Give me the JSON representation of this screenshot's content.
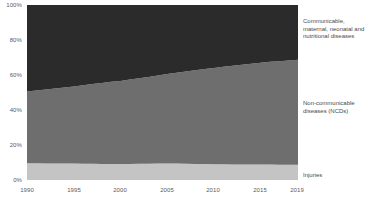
{
  "chart_data": {
    "type": "area",
    "stacked": true,
    "normalized": true,
    "title": "",
    "subtitle": "",
    "xlabel": "",
    "ylabel": "",
    "xlim": [
      1990,
      2019
    ],
    "ylim": [
      0,
      100
    ],
    "grid": false,
    "legend_position": "right",
    "x": [
      1990,
      1991,
      1992,
      1993,
      1994,
      1995,
      1996,
      1997,
      1998,
      1999,
      2000,
      2001,
      2002,
      2003,
      2004,
      2005,
      2006,
      2007,
      2008,
      2009,
      2010,
      2011,
      2012,
      2013,
      2014,
      2015,
      2016,
      2017,
      2018,
      2019
    ],
    "x_tick_labels": [
      "1990",
      "1995",
      "2000",
      "2005",
      "2010",
      "2015",
      "2019"
    ],
    "x_ticks": [
      1990,
      1995,
      2000,
      2005,
      2010,
      2015,
      2019
    ],
    "y_tick_labels": [
      "0%",
      "20%",
      "40%",
      "60%",
      "80%",
      "100%"
    ],
    "y_ticks": [
      0,
      20,
      40,
      60,
      80,
      100
    ],
    "series": [
      {
        "name": "Injuries",
        "color": "#c4c4c4",
        "legend_label": "Injuries",
        "values": [
          9.6,
          9.6,
          9.5,
          9.5,
          9.4,
          9.4,
          9.3,
          9.3,
          9.2,
          9.2,
          9.1,
          9.2,
          9.3,
          9.3,
          9.4,
          9.5,
          9.4,
          9.3,
          9.2,
          9.1,
          9.0,
          9.0,
          8.9,
          8.9,
          8.8,
          8.8,
          8.8,
          8.7,
          8.7,
          8.7
        ]
      },
      {
        "name": "Non-communicable diseases (NCDs)",
        "color": "#6e6e6e",
        "legend_label": "Non-communicable diseases (NCDs)",
        "values": [
          41.0,
          41.6,
          42.2,
          42.8,
          43.4,
          44.1,
          44.8,
          45.5,
          46.2,
          46.9,
          47.5,
          48.2,
          48.9,
          49.6,
          50.3,
          51.1,
          51.9,
          52.7,
          53.5,
          54.3,
          55.0,
          55.7,
          56.4,
          57.0,
          57.6,
          58.2,
          58.7,
          59.2,
          59.6,
          60.0
        ]
      },
      {
        "name": "Communicable, maternal, neonatal and nutritional diseases",
        "color": "#2b2b2b",
        "legend_label": "Communicable, maternal, neonatal and nutritional diseases",
        "values": [
          49.4,
          48.8,
          48.3,
          47.7,
          47.2,
          46.5,
          45.9,
          45.2,
          44.6,
          43.9,
          43.4,
          42.6,
          41.8,
          41.1,
          40.3,
          39.4,
          38.7,
          38.0,
          37.3,
          36.6,
          36.0,
          35.3,
          34.7,
          34.1,
          33.6,
          33.0,
          32.5,
          32.1,
          31.7,
          31.3
        ]
      }
    ]
  },
  "legend": {
    "communicable": "Communicable, maternal, neonatal and nutritional diseases",
    "ncd": "Non-communicable diseases (NCDs)",
    "injuries": "Injuries"
  }
}
